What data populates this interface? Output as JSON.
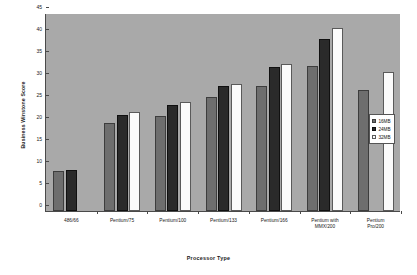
{
  "chart_data": {
    "type": "bar",
    "title": "",
    "xlabel": "Processor Type",
    "ylabel": "Business Winstone Score",
    "ylim": [
      0,
      45
    ],
    "yticks": [
      0,
      5,
      10,
      15,
      20,
      25,
      30,
      35,
      40,
      45
    ],
    "grid": false,
    "legend_position": "right",
    "categories": [
      "486/66",
      "Pentium/75",
      "Pentium/100",
      "Pentium/133",
      "Pentium/166",
      "Pentium with MMX/200",
      "Pentium Pro/200"
    ],
    "category_lines": [
      [
        "486/66"
      ],
      [
        "Pentium/75"
      ],
      [
        "Pentium/100"
      ],
      [
        "Pentium/133"
      ],
      [
        "Pentium/166"
      ],
      [
        "Pentium with",
        "MMX/200"
      ],
      [
        "Pentium",
        "Pro/200"
      ]
    ],
    "series": [
      {
        "name": "16MB",
        "color": "#6e6e6e",
        "values": [
          9.0,
          20.0,
          21.7,
          25.8,
          28.5,
          33.0,
          27.5
        ]
      },
      {
        "name": "24MB",
        "color": "#2a2a2a",
        "values": [
          9.3,
          21.8,
          24.2,
          28.5,
          32.8,
          39.0,
          null
        ]
      },
      {
        "name": "32MB",
        "color": "#fbfbfb",
        "values": [
          null,
          22.5,
          24.8,
          28.8,
          33.3,
          41.5,
          31.5
        ]
      }
    ]
  },
  "colors": {
    "plot_background": "#a9a9a9",
    "page_background": "#ffffff",
    "axis": "#4a4a4a",
    "text": "#202020"
  }
}
